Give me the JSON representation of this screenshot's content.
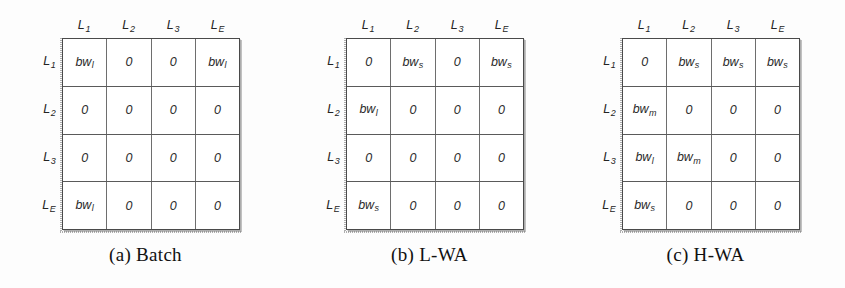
{
  "figure": {
    "kind": "bandwidth-allocation-matrices",
    "panel_count": 3
  },
  "panels": [
    {
      "id": "a",
      "caption": "(a) Batch",
      "col_headers": [
        "L1",
        "L2",
        "L3",
        "LE"
      ],
      "row_labels": [
        "L1",
        "L2",
        "L3",
        "LE"
      ],
      "rows": [
        [
          {
            "base": "bw",
            "sub": "l"
          },
          {
            "base": "0",
            "sub": ""
          },
          {
            "base": "0",
            "sub": ""
          },
          {
            "base": "bw",
            "sub": "l"
          }
        ],
        [
          {
            "base": "0",
            "sub": ""
          },
          {
            "base": "0",
            "sub": ""
          },
          {
            "base": "0",
            "sub": ""
          },
          {
            "base": "0",
            "sub": ""
          }
        ],
        [
          {
            "base": "0",
            "sub": ""
          },
          {
            "base": "0",
            "sub": ""
          },
          {
            "base": "0",
            "sub": ""
          },
          {
            "base": "0",
            "sub": ""
          }
        ],
        [
          {
            "base": "bw",
            "sub": "l"
          },
          {
            "base": "0",
            "sub": ""
          },
          {
            "base": "0",
            "sub": ""
          },
          {
            "base": "0",
            "sub": ""
          }
        ]
      ]
    },
    {
      "id": "b",
      "caption": "(b) L-WA",
      "col_headers": [
        "L1",
        "L2",
        "L3",
        "LE"
      ],
      "row_labels": [
        "L1",
        "L2",
        "L3",
        "LE"
      ],
      "rows": [
        [
          {
            "base": "0",
            "sub": ""
          },
          {
            "base": "bw",
            "sub": "s"
          },
          {
            "base": "0",
            "sub": ""
          },
          {
            "base": "bw",
            "sub": "s"
          }
        ],
        [
          {
            "base": "bw",
            "sub": "l"
          },
          {
            "base": "0",
            "sub": ""
          },
          {
            "base": "0",
            "sub": ""
          },
          {
            "base": "0",
            "sub": ""
          }
        ],
        [
          {
            "base": "0",
            "sub": ""
          },
          {
            "base": "0",
            "sub": ""
          },
          {
            "base": "0",
            "sub": ""
          },
          {
            "base": "0",
            "sub": ""
          }
        ],
        [
          {
            "base": "bw",
            "sub": "s"
          },
          {
            "base": "0",
            "sub": ""
          },
          {
            "base": "0",
            "sub": ""
          },
          {
            "base": "0",
            "sub": ""
          }
        ]
      ]
    },
    {
      "id": "c",
      "caption": "(c) H-WA",
      "col_headers": [
        "L1",
        "L2",
        "L3",
        "LE"
      ],
      "row_labels": [
        "L1",
        "L2",
        "L3",
        "LE"
      ],
      "rows": [
        [
          {
            "base": "0",
            "sub": ""
          },
          {
            "base": "bw",
            "sub": "s"
          },
          {
            "base": "bw",
            "sub": "s"
          },
          {
            "base": "bw",
            "sub": "s"
          }
        ],
        [
          {
            "base": "bw",
            "sub": "m"
          },
          {
            "base": "0",
            "sub": ""
          },
          {
            "base": "0",
            "sub": ""
          },
          {
            "base": "0",
            "sub": ""
          }
        ],
        [
          {
            "base": "bw",
            "sub": "l"
          },
          {
            "base": "bw",
            "sub": "m"
          },
          {
            "base": "0",
            "sub": ""
          },
          {
            "base": "0",
            "sub": ""
          }
        ],
        [
          {
            "base": "bw",
            "sub": "s"
          },
          {
            "base": "0",
            "sub": ""
          },
          {
            "base": "0",
            "sub": ""
          },
          {
            "base": "0",
            "sub": ""
          }
        ]
      ]
    }
  ],
  "label_parts": {
    "L1": {
      "base": "L",
      "sub": "1"
    },
    "L2": {
      "base": "L",
      "sub": "2"
    },
    "L3": {
      "base": "L",
      "sub": "3"
    },
    "LE": {
      "base": "L",
      "sub": "E"
    }
  },
  "colors": {
    "page_background": "#fdfdfd",
    "cell_background": "#ffffff",
    "grid_line": "#5a5a5a",
    "text": "#232323"
  }
}
